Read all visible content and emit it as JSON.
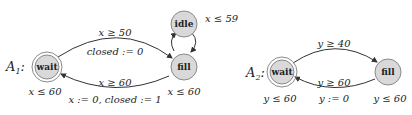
{
  "automata": [
    {
      "name": "A",
      "subscript": "1",
      "suffix": ":",
      "states": [
        {
          "id": "wait",
          "label": "wait",
          "initial": true,
          "invariant": "x ≤ 60"
        },
        {
          "id": "fill",
          "label": "fill",
          "initial": false,
          "invariant": "x ≤ 60"
        },
        {
          "id": "idle",
          "label": "idle",
          "initial": false,
          "invariant": "x ≤ 59"
        }
      ],
      "edges": [
        {
          "from": "wait",
          "to": "fill",
          "guard": "x ≥ 50",
          "update": "closed := 0"
        },
        {
          "from": "fill",
          "to": "wait",
          "guard": "x ≥ 60",
          "update": "x := 0, closed := 1"
        },
        {
          "from": "fill",
          "to": "idle",
          "guard": "",
          "update": ""
        },
        {
          "from": "idle",
          "to": "fill",
          "guard": "",
          "update": ""
        }
      ]
    },
    {
      "name": "A",
      "subscript": "2",
      "suffix": ":",
      "states": [
        {
          "id": "wait",
          "label": "wait",
          "initial": true,
          "invariant": "y ≤ 60"
        },
        {
          "id": "fill",
          "label": "fill",
          "initial": false,
          "invariant": "y ≤ 60"
        }
      ],
      "edges": [
        {
          "from": "wait",
          "to": "fill",
          "guard": "y ≥ 40",
          "update": ""
        },
        {
          "from": "fill",
          "to": "wait",
          "guard": "y ≥ 60",
          "update": "y := 0"
        }
      ]
    }
  ],
  "colors": {
    "state_fill": "#d9d9d9",
    "state_stroke": "#8a8a8a",
    "edge": "#333333",
    "text": "#222222"
  }
}
